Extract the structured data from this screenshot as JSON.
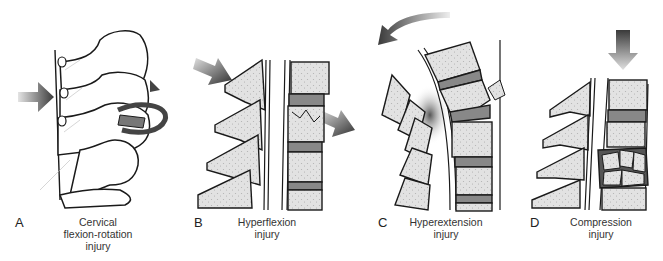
{
  "figure": {
    "panels": [
      {
        "letter": "A",
        "caption_lines": [
          "Cervical",
          "flexion-rotation",
          "injury"
        ],
        "force": "arrow from left with rotation arrow"
      },
      {
        "letter": "B",
        "caption_lines": [
          "Hyperflexion",
          "injury"
        ],
        "force": "diagonal arrows top-left and right"
      },
      {
        "letter": "C",
        "caption_lines": [
          "Hyperextension",
          "injury"
        ],
        "force": "curved arrow to the left"
      },
      {
        "letter": "D",
        "caption_lines": [
          "Compression",
          "injury"
        ],
        "force": "downward arrow"
      }
    ],
    "colors": {
      "line": "#1a1a1a",
      "bone_fill": "#dcdcdc",
      "disc_fill": "#8a8a8a",
      "arrow_dark": "#3a3a3a",
      "arrow_light": "#d8d8d8"
    }
  }
}
